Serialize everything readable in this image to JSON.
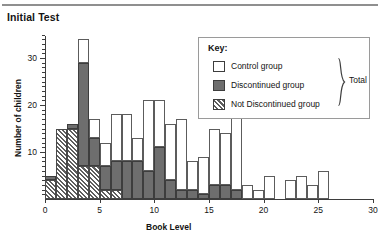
{
  "page": {
    "title": "Initial Test"
  },
  "legend": {
    "title": "Key:",
    "items": [
      {
        "label": "Control group",
        "swatch": "white-square-icon",
        "color": "#ffffff"
      },
      {
        "label": "Discontinued group",
        "swatch": "filled-square-icon",
        "color": "#6e6e6e"
      },
      {
        "label": "Not Discontinued group",
        "swatch": "hatched-square-icon",
        "color": "#5e5e5e"
      }
    ],
    "brace_label": "Total",
    "brace_icon": "curly-brace-icon"
  },
  "chart_data": {
    "type": "bar",
    "title": "Initial Test",
    "xlabel": "Book Level",
    "ylabel": "Number of children",
    "xlim": [
      0,
      30
    ],
    "ylim": [
      0,
      35
    ],
    "xticks": [
      0,
      5,
      10,
      15,
      20,
      25,
      30
    ],
    "yticks": [
      10,
      20,
      30
    ],
    "ytick_minor_step": 1,
    "grid": false,
    "stacked": true,
    "legend_position": "upper-right",
    "bar_width_units": 1,
    "categories": [
      0,
      1,
      2,
      3,
      4,
      5,
      6,
      7,
      8,
      9,
      10,
      11,
      12,
      13,
      14,
      15,
      16,
      17,
      18,
      19,
      20,
      21,
      22,
      23,
      24,
      25,
      26
    ],
    "series": [
      {
        "name": "Not Discontinued group",
        "color": "#5e5e5e",
        "fill": "hatched",
        "values": [
          4,
          15,
          15,
          7,
          7,
          2,
          2,
          0,
          0,
          0,
          0,
          0,
          0,
          0,
          0,
          0,
          0,
          0,
          0,
          0,
          0,
          0,
          0,
          0,
          0,
          0,
          0
        ]
      },
      {
        "name": "Discontinued group",
        "color": "#6e6e6e",
        "fill": "solid",
        "values": [
          1,
          0,
          1,
          22,
          6,
          5,
          6,
          8,
          8,
          6,
          11,
          4,
          2,
          2,
          1,
          3,
          3,
          2,
          0,
          0,
          0,
          0,
          0,
          0,
          0,
          0,
          0
        ]
      },
      {
        "name": "Control group",
        "color": "#ffffff",
        "fill": "white",
        "values": [
          0,
          0,
          0,
          5,
          4,
          5,
          10,
          10,
          5,
          15,
          10,
          12,
          15,
          6,
          8,
          12,
          11,
          16,
          3,
          2,
          5,
          0,
          4,
          5,
          3,
          6,
          0
        ]
      }
    ],
    "totals": [
      5,
      15,
      16,
      34,
      17,
      12,
      18,
      18,
      13,
      21,
      21,
      16,
      17,
      8,
      9,
      15,
      14,
      18,
      3,
      2,
      5,
      0,
      4,
      5,
      3,
      6,
      0
    ]
  }
}
